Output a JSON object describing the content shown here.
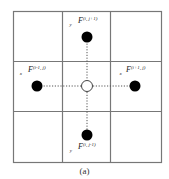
{
  "diagram": {
    "type": "staggered-grid-stencil",
    "grid": {
      "rows": 3,
      "cols": 3,
      "line_color": "#777777"
    },
    "center_node": {
      "label": "",
      "style": "hollow-circle"
    },
    "nodes": [
      {
        "id": "top",
        "base": "F",
        "sub": "y",
        "sup": "(i, j+1)",
        "style": "filled-circle"
      },
      {
        "id": "left",
        "base": "F",
        "sub": "x",
        "sup": "(i-1, j)",
        "style": "filled-circle"
      },
      {
        "id": "right",
        "base": "F",
        "sub": "x",
        "sup": "(i+1, j)",
        "style": "filled-circle"
      },
      {
        "id": "bottom",
        "base": "F",
        "sub": "y",
        "sup": "(i, j-1)",
        "style": "filled-circle"
      }
    ],
    "connectors": "dotted",
    "caption": "(a)"
  }
}
